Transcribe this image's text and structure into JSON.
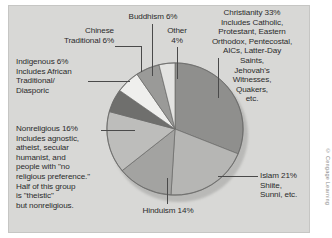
{
  "figure": {
    "credit": "© Cengage Learning",
    "background_color": "#d8d8d6",
    "text_color": "#2b2b2b"
  },
  "chart_data": {
    "type": "pie",
    "title": "",
    "subtitle": "",
    "xlabel": "",
    "ylabel": "",
    "legend_position": "callout-labels",
    "grid": false,
    "total_percent": 106,
    "start_angle_deg": 0,
    "direction": "clockwise",
    "categories": [
      "Christianity",
      "Islam",
      "Hinduism",
      "Nonreligious",
      "Indigenous",
      "Chinese Traditional",
      "Buddhism",
      "Other"
    ],
    "values": [
      33,
      21,
      14,
      16,
      6,
      6,
      6,
      4
    ],
    "colors": [
      "#8f8f8d",
      "#b6b6b4",
      "#a3a3a1",
      "#bdbdbb",
      "#6f6f6d",
      "#efefed",
      "#9a9a98",
      "#e3e3e1"
    ],
    "slices": [
      {
        "name": "Christianity",
        "value": 33,
        "label": "Christianity 33%",
        "detail": "Includes Catholic,\nProtestant, Eastern\nOrthodox, Pentecostal,\nAICs, Latter-Day\nSaints,\nJehovah's\nWitnesses,\nQuakers,\netc.",
        "color": "#8f8f8d"
      },
      {
        "name": "Islam",
        "value": 21,
        "label": "Islam 21%",
        "detail": "Shiite,\nSunni, etc.",
        "color": "#b6b6b4"
      },
      {
        "name": "Hinduism",
        "value": 14,
        "label": "Hinduism 14%",
        "detail": "",
        "color": "#a3a3a1"
      },
      {
        "name": "Nonreligious",
        "value": 16,
        "label": "Nonreligious 16%",
        "detail": "Includes agnostic,\natheist, secular\nhumanist, and\npeople with \"no\nreligious preference.\"\nHalf of this group\nis \"theistic\"\nbut nonreligious.",
        "color": "#bdbdbb"
      },
      {
        "name": "Indigenous",
        "value": 6,
        "label": "Indigenous 6%",
        "detail": "Includes African\nTraditional/\nDiasporic",
        "color": "#6f6f6d"
      },
      {
        "name": "Chinese Traditional",
        "value": 6,
        "label": "Chinese\nTraditional 6%",
        "detail": "",
        "color": "#efefed"
      },
      {
        "name": "Buddhism",
        "value": 6,
        "label": "Buddhism 6%",
        "detail": "",
        "color": "#9a9a98"
      },
      {
        "name": "Other",
        "value": 4,
        "label": "Other\n4%",
        "detail": "",
        "color": "#e3e3e1"
      }
    ]
  },
  "labels": {
    "christianity": "Christianity 33%\nIncludes Catholic,\nProtestant, Eastern\nOrthodox, Pentecostal,\nAICs, Latter-Day\nSaints,\nJehovah's\nWitnesses,\nQuakers,\netc.",
    "islam": "Islam 21%\nShiite,\nSunni, etc.",
    "hinduism": "Hinduism 14%",
    "nonreligious": "Nonreligious 16%\nIncludes agnostic,\natheist, secular\nhumanist, and\npeople with \"no\nreligious preference.\"\nHalf of this group\nis \"theistic\"\nbut nonreligious.",
    "indigenous": "Indigenous 6%\nIncludes African\nTraditional/\nDiasporic",
    "chinese_traditional": "Chinese\nTraditional 6%",
    "buddhism": "Buddhism 6%",
    "other": "Other\n4%"
  }
}
